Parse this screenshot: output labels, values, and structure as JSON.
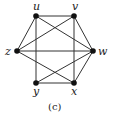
{
  "caption": "(c)",
  "nodes": [
    {
      "id": "u",
      "label": "u",
      "x": 36,
      "y": 16,
      "lx": 33,
      "ly": 10
    },
    {
      "id": "v",
      "label": "v",
      "x": 74,
      "y": 16,
      "lx": 72,
      "ly": 10
    },
    {
      "id": "w",
      "label": "w",
      "x": 93,
      "y": 51,
      "lx": 98,
      "ly": 55
    },
    {
      "id": "x",
      "label": "x",
      "x": 74,
      "y": 83,
      "lx": 71,
      "ly": 95
    },
    {
      "id": "y",
      "label": "y",
      "x": 36,
      "y": 83,
      "lx": 33,
      "ly": 95
    },
    {
      "id": "z",
      "label": "z",
      "x": 17,
      "y": 51,
      "lx": 5,
      "ly": 55
    }
  ],
  "edges": [
    [
      "u",
      "v"
    ],
    [
      "u",
      "z"
    ],
    [
      "u",
      "w"
    ],
    [
      "u",
      "y"
    ],
    [
      "v",
      "w"
    ],
    [
      "v",
      "z"
    ],
    [
      "v",
      "x"
    ],
    [
      "z",
      "w"
    ],
    [
      "z",
      "x"
    ],
    [
      "w",
      "y"
    ],
    [
      "w",
      "x"
    ],
    [
      "y",
      "x"
    ]
  ],
  "colors": {
    "edge": "#333333",
    "node": "#111111"
  }
}
